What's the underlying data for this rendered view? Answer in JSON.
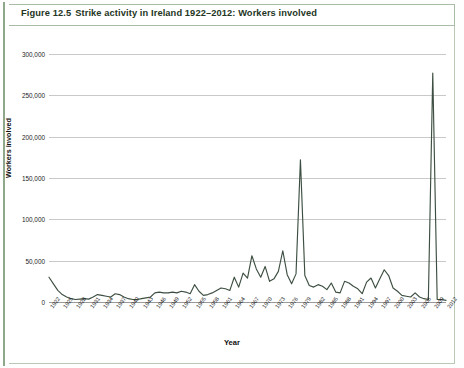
{
  "caption": {
    "figure_number": "Figure 12.5",
    "title": "Strike activity in Ireland 1922–2012: Workers involved"
  },
  "axis": {
    "y_title": "Workers involved",
    "x_title": "Year",
    "y_ticks": [
      "0",
      "50,000",
      "100,000",
      "150,000",
      "200,000",
      "250,000",
      "300,000"
    ]
  },
  "colors": {
    "line": "#3d4f42",
    "grid": "#c9c9c9",
    "frame": "#a9bda6",
    "rule": "#8fa88c",
    "text": "#1b1b1b"
  },
  "chart_data": {
    "type": "line",
    "title": "Strike activity in Ireland 1922–2012: Workers involved",
    "xlabel": "Year",
    "ylabel": "Workers involved",
    "ylim": [
      0,
      300000
    ],
    "ytick_step": 50000,
    "grid": true,
    "legend": "none",
    "x_tick_labels": [
      "1922",
      "1925",
      "1928",
      "1931",
      "1934",
      "1937",
      "1940",
      "1943",
      "1946",
      "1949",
      "1952",
      "1955",
      "1958",
      "1961",
      "1964",
      "1967",
      "1970",
      "1973",
      "1976",
      "1979",
      "1982",
      "1985",
      "1988",
      "1991",
      "1994",
      "1997",
      "2000",
      "2003",
      "2006",
      "2009",
      "2012"
    ],
    "x_tick_step": 3,
    "x": [
      1922,
      1923,
      1924,
      1925,
      1926,
      1927,
      1928,
      1929,
      1930,
      1931,
      1932,
      1933,
      1934,
      1935,
      1936,
      1937,
      1938,
      1939,
      1940,
      1941,
      1942,
      1943,
      1944,
      1945,
      1946,
      1947,
      1948,
      1949,
      1950,
      1951,
      1952,
      1953,
      1954,
      1955,
      1956,
      1957,
      1958,
      1959,
      1960,
      1961,
      1962,
      1963,
      1964,
      1965,
      1966,
      1967,
      1968,
      1969,
      1970,
      1971,
      1972,
      1973,
      1974,
      1975,
      1976,
      1977,
      1978,
      1979,
      1980,
      1981,
      1982,
      1983,
      1984,
      1985,
      1986,
      1987,
      1988,
      1989,
      1990,
      1991,
      1992,
      1993,
      1994,
      1995,
      1996,
      1997,
      1998,
      1999,
      2000,
      2001,
      2002,
      2003,
      2004,
      2005,
      2006,
      2007,
      2008,
      2009,
      2010,
      2011,
      2012
    ],
    "values": [
      30000,
      22000,
      14000,
      9000,
      6000,
      4000,
      3000,
      3500,
      4000,
      3500,
      6000,
      9000,
      8000,
      7000,
      6000,
      10000,
      9000,
      6000,
      4000,
      3000,
      3000,
      4000,
      5000,
      6000,
      11000,
      12000,
      11000,
      11000,
      12000,
      11000,
      13000,
      12000,
      10000,
      21000,
      13000,
      8000,
      9000,
      11000,
      14000,
      17000,
      16000,
      14000,
      30000,
      18000,
      35000,
      29000,
      56000,
      40000,
      30000,
      43000,
      25000,
      28000,
      37000,
      62000,
      33000,
      22000,
      34000,
      172000,
      32000,
      20000,
      18000,
      21000,
      19000,
      15000,
      23000,
      12000,
      11000,
      25000,
      23000,
      19000,
      16000,
      10000,
      24000,
      29000,
      17000,
      28000,
      39000,
      32000,
      17000,
      13000,
      8000,
      7000,
      6000,
      11000,
      6000,
      4000,
      3000,
      277000,
      3000,
      3000,
      2000
    ]
  }
}
